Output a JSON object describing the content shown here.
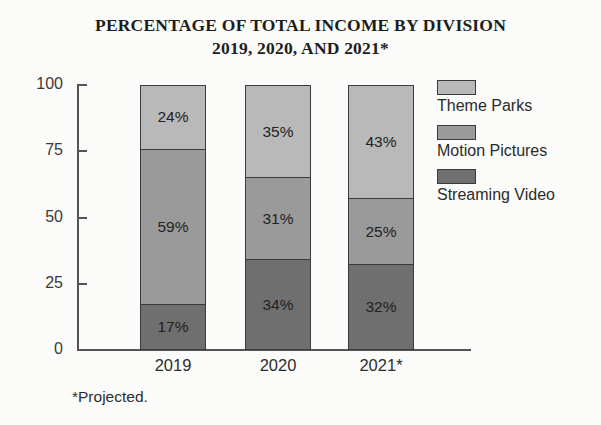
{
  "chart_data": {
    "type": "bar",
    "title": "PERCENTAGE OF TOTAL INCOME BY DIVISION",
    "subtitle": "2019, 2020, AND 2021*",
    "xlabel": "",
    "ylabel": "",
    "ylim": [
      0,
      100
    ],
    "yticks": [
      100,
      75,
      50,
      25,
      0
    ],
    "ytick_labels": [
      "100",
      "75",
      "50",
      "25",
      "0"
    ],
    "grid": false,
    "stacked": true,
    "legend_position": "right",
    "categories": [
      "2019",
      "2020",
      "2021*"
    ],
    "series": [
      {
        "name": "Theme Parks",
        "values": [
          24,
          35,
          43
        ],
        "color": "#b9b9b9"
      },
      {
        "name": "Motion Pictures",
        "values": [
          59,
          31,
          25
        ],
        "color": "#9a9a9a"
      },
      {
        "name": "Streaming Video",
        "values": [
          17,
          34,
          32
        ],
        "color": "#6f6f6f"
      }
    ],
    "bars": [
      {
        "category": "2019",
        "segments": [
          {
            "series": "Theme Parks",
            "value": 24,
            "label": "24%"
          },
          {
            "series": "Motion Pictures",
            "value": 59,
            "label": "59%"
          },
          {
            "series": "Streaming Video",
            "value": 17,
            "label": "17%"
          }
        ]
      },
      {
        "category": "2020",
        "segments": [
          {
            "series": "Theme Parks",
            "value": 35,
            "label": "35%"
          },
          {
            "series": "Motion Pictures",
            "value": 31,
            "label": "31%"
          },
          {
            "series": "Streaming Video",
            "value": 34,
            "label": "34%"
          }
        ]
      },
      {
        "category": "2021*",
        "segments": [
          {
            "series": "Theme Parks",
            "value": 43,
            "label": "43%"
          },
          {
            "series": "Motion Pictures",
            "value": 25,
            "label": "25%"
          },
          {
            "series": "Streaming Video",
            "value": 32,
            "label": "32%"
          }
        ]
      }
    ],
    "annotations": [
      "*Projected."
    ]
  },
  "footnote": "*Projected.",
  "colors": {
    "background": "#fbfbf9",
    "axis": "#545454",
    "outline": "#3b3b3b",
    "text": "#2a2a2a"
  }
}
